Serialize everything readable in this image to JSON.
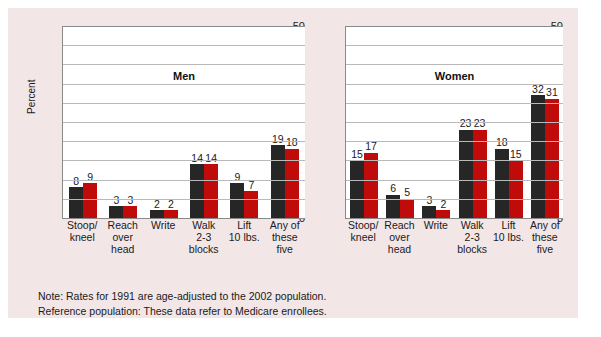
{
  "legend": {
    "series_1_label": "1991",
    "series_1_color": "#262626",
    "series_2_label": "2002",
    "series_2_color": "#c00b0b"
  },
  "notes": {
    "line1": "Note: Rates for 1991 are age-adjusted to the 2002 population.",
    "line2": "Reference population: These data refer to Medicare enrollees."
  },
  "axis": {
    "ylabel": "Percent",
    "ticks": [
      "50",
      "45",
      "40",
      "35",
      "30",
      "25",
      "20",
      "15",
      "10",
      "5",
      "0"
    ]
  },
  "chart_data": [
    {
      "type": "bar",
      "title": "Men",
      "xlabel": "",
      "ylabel": "Percent",
      "ylim": [
        0,
        50
      ],
      "grid": true,
      "legend_position": "top-right",
      "categories": [
        "Stoop/ kneel",
        "Reach over head",
        "Write",
        "Walk 2-3 blocks",
        "Lift 10 lbs.",
        "Any of these five"
      ],
      "category_lines": [
        [
          "Stoop/",
          "kneel"
        ],
        [
          "Reach",
          "over",
          "head"
        ],
        [
          "Write"
        ],
        [
          "Walk",
          "2-3",
          "blocks"
        ],
        [
          "Lift",
          "10 lbs."
        ],
        [
          "Any of",
          "these",
          "five"
        ]
      ],
      "series": [
        {
          "name": "1991",
          "values": [
            8,
            3,
            2,
            14,
            9,
            19
          ]
        },
        {
          "name": "2002",
          "values": [
            9,
            3,
            2,
            14,
            7,
            18
          ]
        }
      ]
    },
    {
      "type": "bar",
      "title": "Women",
      "xlabel": "",
      "ylabel": "Percent",
      "ylim": [
        0,
        50
      ],
      "grid": true,
      "legend_position": "top-right",
      "categories": [
        "Stoop/ kneel",
        "Reach over head",
        "Write",
        "Walk 2-3 blocks",
        "Lift 10 lbs.",
        "Any of these five"
      ],
      "category_lines": [
        [
          "Stoop/",
          "kneel"
        ],
        [
          "Reach",
          "over",
          "head"
        ],
        [
          "Write"
        ],
        [
          "Walk",
          "2-3",
          "blocks"
        ],
        [
          "Lift",
          "10 lbs."
        ],
        [
          "Any of",
          "these",
          "five"
        ]
      ],
      "series": [
        {
          "name": "1991",
          "values": [
            15,
            6,
            3,
            23,
            18,
            32
          ]
        },
        {
          "name": "2002",
          "values": [
            17,
            5,
            2,
            23,
            15,
            31
          ]
        }
      ]
    }
  ]
}
